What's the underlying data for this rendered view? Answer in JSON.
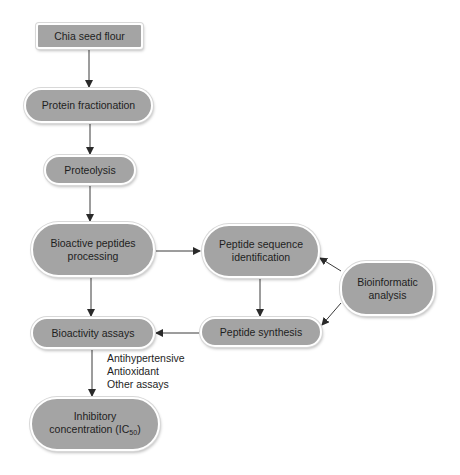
{
  "nodes": {
    "chia_seed_flour": "Chia seed flour",
    "protein_fractionation": "Protein fractionation",
    "proteolysis": "Proteolysis",
    "bioactive_peptides_line1": "Bioactive peptides",
    "bioactive_peptides_line2": "processing",
    "peptide_sequence_line1": "Peptide sequence",
    "peptide_sequence_line2": "identification",
    "bioinformatic_line1": "Bioinformatic",
    "bioinformatic_line2": "analysis",
    "peptide_synthesis": "Peptide synthesis",
    "bioactivity_assays": "Bioactivity assays",
    "inhibitory_line1": "Inhibitory",
    "inhibitory_line2_prefix": "concentration (IC",
    "inhibitory_subscript": "50",
    "inhibitory_line2_suffix": ")"
  },
  "annotation": {
    "assays": [
      "Antihypertensive",
      "Antioxidant",
      "Other assays"
    ]
  },
  "edges": [
    {
      "from": "Chia seed flour",
      "to": "Protein fractionation"
    },
    {
      "from": "Protein fractionation",
      "to": "Proteolysis"
    },
    {
      "from": "Proteolysis",
      "to": "Bioactive peptides processing"
    },
    {
      "from": "Bioactive peptides processing",
      "to": "Peptide sequence identification"
    },
    {
      "from": "Bioactive peptides processing",
      "to": "Bioactivity assays"
    },
    {
      "from": "Peptide sequence identification",
      "to": "Peptide synthesis"
    },
    {
      "from": "Bioinformatic analysis",
      "to": "Peptide sequence identification"
    },
    {
      "from": "Bioinformatic analysis",
      "to": "Peptide synthesis"
    },
    {
      "from": "Peptide synthesis",
      "to": "Bioactivity assays"
    },
    {
      "from": "Bioactivity assays",
      "to": "Inhibitory concentration (IC50)"
    }
  ],
  "colors": {
    "node_fill": "#9c9c9c",
    "node_text": "#1e1e1e",
    "edge": "#2a2a2a"
  }
}
